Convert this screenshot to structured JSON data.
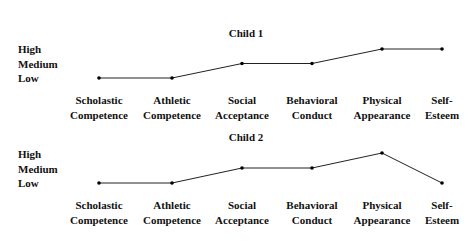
{
  "chart_data": [
    {
      "type": "line",
      "title": "Child 1",
      "categories": [
        "Scholastic Competence",
        "Athletic Competence",
        "Social Acceptance",
        "Behavioral Conduct",
        "Physical Appearance",
        "Self-Esteem"
      ],
      "category_lines": [
        [
          "Scholastic",
          "Competence"
        ],
        [
          "Athletic",
          "Competence"
        ],
        [
          "Social",
          "Acceptance"
        ],
        [
          "Behavioral",
          "Conduct"
        ],
        [
          "Physical",
          "Appearance"
        ],
        [
          "Self-",
          "Esteem"
        ]
      ],
      "y_levels": [
        "High",
        "Medium",
        "Low"
      ],
      "values": [
        "Low",
        "Low",
        "Medium",
        "Medium",
        "High",
        "High"
      ],
      "values_numeric": [
        1,
        1,
        2,
        2,
        3,
        3
      ],
      "ylim": [
        1,
        3
      ],
      "grid": false
    },
    {
      "type": "line",
      "title": "Child 2",
      "categories": [
        "Scholastic Competence",
        "Athletic Competence",
        "Social Acceptance",
        "Behavioral Conduct",
        "Physical Appearance",
        "Self-Esteem"
      ],
      "category_lines": [
        [
          "Scholastic",
          "Competence"
        ],
        [
          "Athletic",
          "Competence"
        ],
        [
          "Social",
          "Acceptance"
        ],
        [
          "Behavioral",
          "Conduct"
        ],
        [
          "Physical",
          "Appearance"
        ],
        [
          "Self-",
          "Esteem"
        ]
      ],
      "y_levels": [
        "High",
        "Medium",
        "Low"
      ],
      "values": [
        "Low",
        "Low",
        "Medium",
        "Medium",
        "High",
        "Low"
      ],
      "values_numeric": [
        1,
        1,
        2,
        2,
        3,
        1
      ],
      "ylim": [
        1,
        3
      ],
      "grid": false
    }
  ],
  "style": {
    "line_color": "#222222",
    "text_color": "#111111"
  }
}
